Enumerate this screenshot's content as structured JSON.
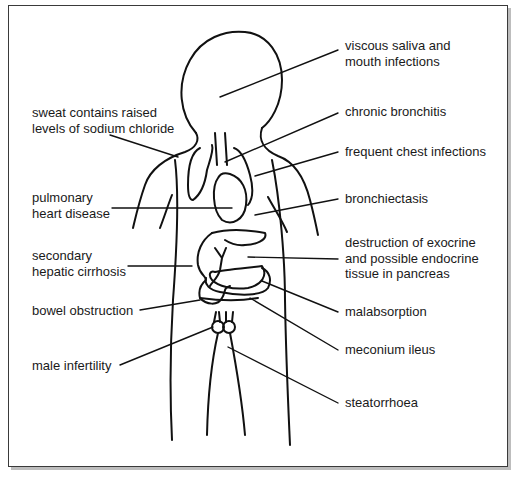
{
  "diagram": {
    "type": "annotated body outline",
    "line_color": "#111111",
    "text_color": "#1a1a1a",
    "labels_left": [
      {
        "id": "sweat",
        "text": "sweat contains raised\nlevels of sodium chloride"
      },
      {
        "id": "pulmonary-heart",
        "text": "pulmonary\nheart disease"
      },
      {
        "id": "hepatic-cirrhosis",
        "text": "secondary\nhepatic cirrhosis"
      },
      {
        "id": "bowel-obstruction",
        "text": "bowel obstruction"
      },
      {
        "id": "male-infertility",
        "text": "male infertility"
      }
    ],
    "labels_right": [
      {
        "id": "saliva",
        "text": "viscous saliva and\nmouth infections"
      },
      {
        "id": "bronchitis",
        "text": "chronic bronchitis"
      },
      {
        "id": "chest-infections",
        "text": "frequent chest infections"
      },
      {
        "id": "bronchiectasis",
        "text": "bronchiectasis"
      },
      {
        "id": "pancreas",
        "text": "destruction of exocrine\nand possible endocrine\ntissue in pancreas"
      },
      {
        "id": "malabsorption",
        "text": "malabsorption"
      },
      {
        "id": "meconium-ileus",
        "text": "meconium ileus"
      },
      {
        "id": "steatorrhoea",
        "text": "steatorrhoea"
      }
    ]
  }
}
